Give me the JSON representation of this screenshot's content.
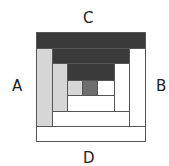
{
  "diagram": {
    "side_labels": {
      "top": "C",
      "left": "A",
      "right": "B",
      "bottom": "D"
    },
    "colors": {
      "dark": "#3a3a3a",
      "light": "#d6d6d6",
      "white": "#ffffff",
      "center": "#6e6e6e",
      "outline": "#555555"
    },
    "rounds": [
      {
        "round": 1,
        "top": "dark",
        "left": "light",
        "right": "white",
        "bottom": "white"
      },
      {
        "round": 2,
        "top": "dark",
        "left": "light",
        "right": "white",
        "bottom": "white"
      },
      {
        "round": 3,
        "top": "dark",
        "left": "light",
        "right": "white",
        "bottom": "white"
      }
    ],
    "center": "center"
  }
}
